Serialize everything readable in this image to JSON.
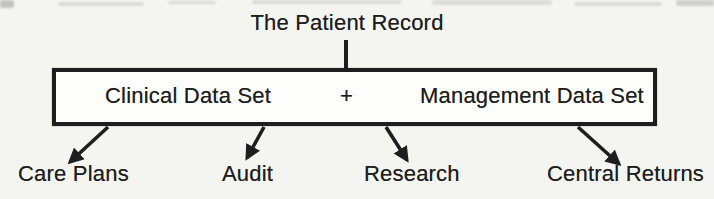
{
  "colors": {
    "ink": "#1e1e1e",
    "page_background": "#f4f4f1",
    "artifact": "#9a9a97"
  },
  "diagram": {
    "title": "The Patient Record",
    "box": {
      "left_label": "Clinical Data Set",
      "separator": "+",
      "right_label": "Management Data Set"
    },
    "outputs": [
      {
        "label": "Care Plans"
      },
      {
        "label": "Audit"
      },
      {
        "label": "Research"
      },
      {
        "label": "Central Returns"
      }
    ]
  }
}
